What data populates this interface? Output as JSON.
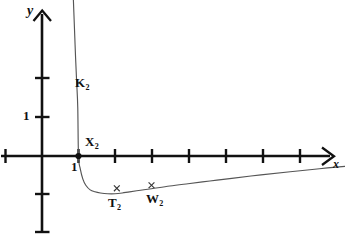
{
  "figure": {
    "title": "",
    "background_color": "#ffffff",
    "stroke_color": "#111111",
    "width": 345,
    "height": 239
  },
  "axes": {
    "x_axis_label": "x",
    "y_axis_label": "y",
    "x_tick_label": "1",
    "y_tick_label": "1",
    "origin_px": {
      "x": 42,
      "y": 156
    },
    "unit_px": {
      "x": 36.5,
      "y": 38.5
    }
  },
  "annotations": {
    "curve_label": {
      "text": "K",
      "sub": "2"
    },
    "intercept_label": {
      "text": "X",
      "sub": "2"
    },
    "minimum_label": {
      "text": "T",
      "sub": "2"
    },
    "point_label": {
      "text": "W",
      "sub": "2"
    }
  },
  "chart_data": {
    "type": "line",
    "title": "",
    "xlabel": "x",
    "ylabel": "y",
    "grid": false,
    "legend": null,
    "xlim": [
      -1.15,
      8.3
    ],
    "ylim": [
      -2.1,
      4.05
    ],
    "xticks": [
      -1,
      1,
      2,
      3,
      4,
      5,
      6,
      7,
      8
    ],
    "yticks": [
      -2,
      -1,
      1,
      2
    ],
    "xtick_labels": {
      "1": "1"
    },
    "ytick_labels": {
      "1": "1"
    },
    "series": [
      {
        "name": "K2",
        "comment": "steeply falling branch from upper left, crosses x-axis at x=1, minimum near x=2, then slowly increasing",
        "x": [
          0.86,
          0.88,
          0.9,
          0.92,
          0.95,
          0.98,
          1.0,
          1.05,
          1.12,
          1.2,
          1.32,
          1.45,
          1.6,
          1.8,
          2.0,
          2.2,
          2.4,
          2.7,
          3.0,
          3.5,
          4.0,
          4.6,
          5.2,
          6.0,
          6.8,
          7.6,
          8.3
        ],
        "y": [
          4.05,
          3.55,
          3.05,
          2.55,
          1.92,
          1.25,
          0.0,
          -0.34,
          -0.6,
          -0.76,
          -0.88,
          -0.93,
          -0.96,
          -0.98,
          -0.98,
          -0.96,
          -0.93,
          -0.89,
          -0.85,
          -0.78,
          -0.72,
          -0.65,
          -0.58,
          -0.49,
          -0.41,
          -0.33,
          -0.27
        ]
      }
    ],
    "points": [
      {
        "name": "X2",
        "label": "X",
        "sub": "2",
        "x": 1.0,
        "y": 0.0,
        "marker": "dot"
      },
      {
        "name": "T2",
        "label": "T",
        "sub": "2",
        "x": 2.05,
        "y": -0.84,
        "marker": "cross"
      },
      {
        "name": "W2",
        "label": "W",
        "sub": "2",
        "x": 3.0,
        "y": -0.76,
        "marker": "cross"
      }
    ]
  }
}
